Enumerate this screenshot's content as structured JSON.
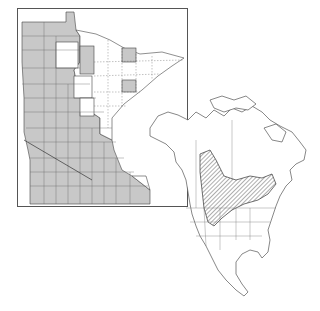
{
  "figure": {
    "type": "species distribution map",
    "panels": [
      {
        "name": "minnesota-county-map",
        "description": "Minnesota counties; shaded counties indicate recorded occurrence"
      },
      {
        "name": "north-america-range-map",
        "description": "North America; hatched area indicates range"
      }
    ]
  },
  "colors": {
    "county_fill": "#c8c8c8",
    "county_empty": "#ffffff",
    "outline": "#444444",
    "hatch": "#333333"
  }
}
